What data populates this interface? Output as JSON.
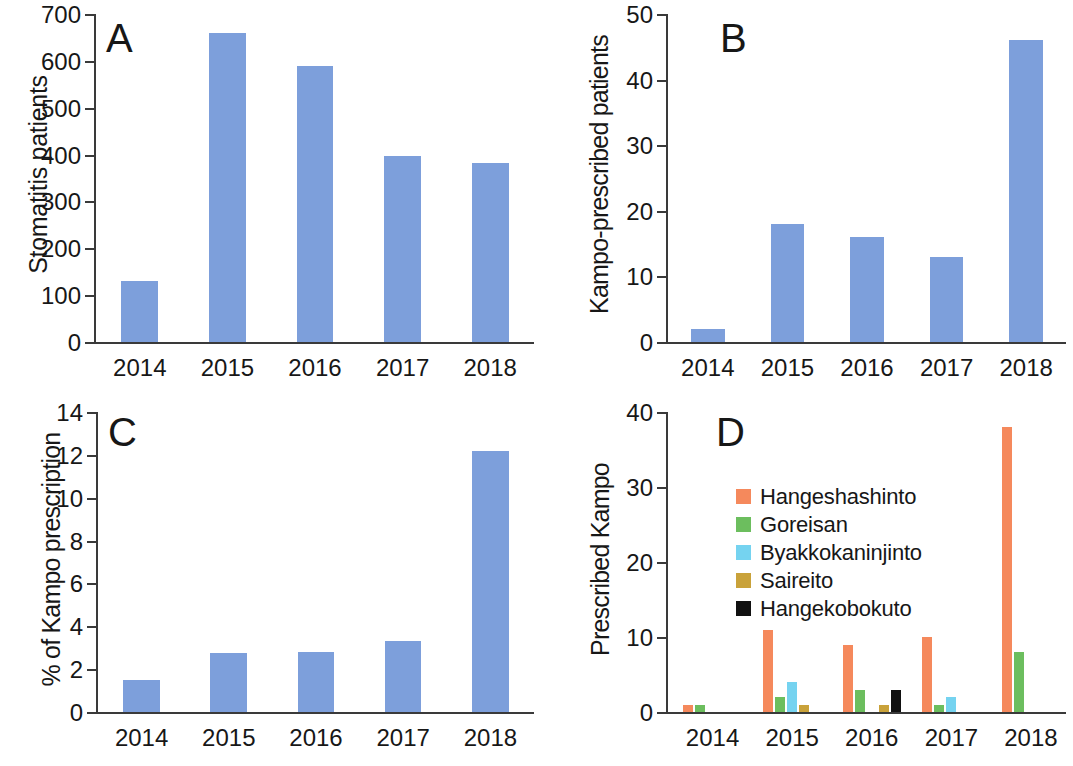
{
  "figure": {
    "width": 1073,
    "height": 766,
    "background": "#ffffff"
  },
  "colors": {
    "blue": "#7d9fdb",
    "orange": "#f5895c",
    "green": "#6cbe5e",
    "lightblue": "#75d3f0",
    "gold": "#c9a23a",
    "black": "#111111",
    "axis": "#3a3a3a",
    "text": "#171717"
  },
  "panels": {
    "a": {
      "letter": "A",
      "ylabel": "Stomatitis patients",
      "ticks": [
        "0",
        "100",
        "200",
        "300",
        "400",
        "500",
        "600",
        "700"
      ],
      "xlabels": [
        "2014",
        "2015",
        "2016",
        "2017",
        "2018"
      ]
    },
    "b": {
      "letter": "B",
      "ylabel": "Kampo-prescribed patients",
      "ticks": [
        "0",
        "10",
        "20",
        "30",
        "40",
        "50"
      ],
      "xlabels": [
        "2014",
        "2015",
        "2016",
        "2017",
        "2018"
      ]
    },
    "c": {
      "letter": "C",
      "ylabel": "% of Kampo prescription",
      "ticks": [
        "0",
        "2",
        "4",
        "6",
        "8",
        "10",
        "12",
        "14"
      ],
      "xlabels": [
        "2014",
        "2015",
        "2016",
        "2017",
        "2018"
      ]
    },
    "d": {
      "letter": "D",
      "ylabel": "Prescribed Kampo",
      "ticks": [
        "0",
        "10",
        "20",
        "30",
        "40"
      ],
      "xlabels": [
        "2014",
        "2015",
        "2016",
        "2017",
        "2018"
      ],
      "legend": [
        {
          "label": "Hangeshashinto",
          "color": "#f5895c"
        },
        {
          "label": "Goreisan",
          "color": "#6cbe5e"
        },
        {
          "label": "Byakkokaninjinto",
          "color": "#75d3f0"
        },
        {
          "label": "Saireito",
          "color": "#c9a23a"
        },
        {
          "label": "Hangekobokuto",
          "color": "#111111"
        }
      ]
    }
  },
  "chart_data": [
    {
      "panel": "A",
      "type": "bar",
      "title": "A",
      "xlabel": "",
      "ylabel": "Stomatitis patients",
      "categories": [
        "2014",
        "2015",
        "2016",
        "2017",
        "2018"
      ],
      "values": [
        131,
        659,
        588,
        398,
        382
      ],
      "ylim": [
        0,
        700
      ],
      "yticks": [
        0,
        100,
        200,
        300,
        400,
        500,
        600,
        700
      ],
      "grid": false,
      "legend": "none",
      "color": "#7d9fdb"
    },
    {
      "panel": "B",
      "type": "bar",
      "title": "B",
      "xlabel": "",
      "ylabel": "Kampo-prescribed patients",
      "categories": [
        "2014",
        "2015",
        "2016",
        "2017",
        "2018"
      ],
      "values": [
        2,
        18,
        16,
        13,
        46
      ],
      "ylim": [
        0,
        50
      ],
      "yticks": [
        0,
        10,
        20,
        30,
        40,
        50
      ],
      "grid": false,
      "legend": "none",
      "color": "#7d9fdb"
    },
    {
      "panel": "C",
      "type": "bar",
      "title": "C",
      "xlabel": "",
      "ylabel": "% of Kampo prescription",
      "categories": [
        "2014",
        "2015",
        "2016",
        "2017",
        "2018"
      ],
      "values": [
        1.5,
        2.75,
        2.8,
        3.3,
        12.2
      ],
      "ylim": [
        0,
        14
      ],
      "yticks": [
        0,
        2,
        4,
        6,
        8,
        10,
        12,
        14
      ],
      "grid": false,
      "legend": "none",
      "color": "#7d9fdb"
    },
    {
      "panel": "D",
      "type": "bar",
      "title": "D",
      "xlabel": "",
      "ylabel": "Prescribed Kampo",
      "categories": [
        "2014",
        "2015",
        "2016",
        "2017",
        "2018"
      ],
      "ylim": [
        0,
        40
      ],
      "yticks": [
        0,
        10,
        20,
        30,
        40
      ],
      "grid": false,
      "legend": "inside-upper-left",
      "series": [
        {
          "name": "Hangeshashinto",
          "color": "#f5895c",
          "values": [
            1,
            11,
            9,
            10,
            38
          ]
        },
        {
          "name": "Goreisan",
          "color": "#6cbe5e",
          "values": [
            1,
            2,
            3,
            1,
            8
          ]
        },
        {
          "name": "Byakkokaninjinto",
          "color": "#75d3f0",
          "values": [
            0,
            4,
            0,
            2,
            0
          ]
        },
        {
          "name": "Saireito",
          "color": "#c9a23a",
          "values": [
            0,
            1,
            1,
            0,
            0
          ]
        },
        {
          "name": "Hangekobokuto",
          "color": "#111111",
          "values": [
            0,
            0,
            3,
            0,
            0
          ]
        }
      ]
    }
  ]
}
